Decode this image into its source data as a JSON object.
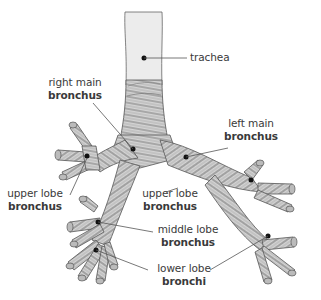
{
  "diagram": {
    "type": "anatomical-illustration",
    "colors": {
      "label_text": "#3a3a3a",
      "leader_line": "#555555",
      "airway_fill": "#d9d9d9",
      "airway_stroke": "#555555",
      "trachea_fill": "#ececec",
      "marker_dot": "#111111",
      "background": "#ffffff"
    },
    "labels": [
      {
        "id": "trachea",
        "line1": "trachea",
        "line2": ""
      },
      {
        "id": "right-main-bronchus",
        "line1": "right main",
        "line2": "bronchus"
      },
      {
        "id": "left-main-bronchus",
        "line1": "left main",
        "line2": "bronchus"
      },
      {
        "id": "right-upper-lobe-bronchus",
        "line1": "upper lobe",
        "line2": "bronchus"
      },
      {
        "id": "left-upper-lobe-bronchus",
        "line1": "upper lobe",
        "line2": "bronchus"
      },
      {
        "id": "middle-lobe-bronchus",
        "line1": "middle lobe",
        "line2": "bronchus"
      },
      {
        "id": "lower-lobe-bronchi",
        "line1": "lower lobe",
        "line2": "bronchi"
      }
    ]
  }
}
